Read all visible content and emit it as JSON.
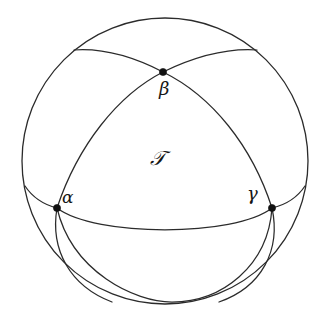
{
  "figure": {
    "background_color": "#ffffff",
    "stroke_color": "#2b2b2b",
    "vertex_color": "#111111",
    "label_color": "#161616"
  },
  "sphere": {
    "outline_name": "sphere-outline-circle",
    "center_x": 165,
    "center_y": 161,
    "radius": 143
  },
  "vertices": [
    {
      "id": "alpha",
      "label": "α",
      "x": 57,
      "y": 208
    },
    {
      "id": "beta",
      "label": "β",
      "x": 163,
      "y": 72
    },
    {
      "id": "gamma",
      "label": "γ",
      "x": 272,
      "y": 208
    }
  ],
  "region": {
    "id": "T",
    "label": "𝒯",
    "x": 163,
    "y": 160
  },
  "arcs": [
    {
      "id": "arc-alpha-beta",
      "from": "alpha",
      "to": "beta",
      "visible": true
    },
    {
      "id": "arc-beta-gamma",
      "from": "beta",
      "to": "gamma",
      "visible": true
    },
    {
      "id": "arc-alpha-gamma",
      "from": "alpha",
      "to": "gamma",
      "visible": true
    },
    {
      "id": "arc-beta-upper-left",
      "from": "beta",
      "to": "sphere-edge-upper-left",
      "visible": true
    },
    {
      "id": "arc-beta-upper-right",
      "from": "beta",
      "to": "sphere-edge-upper-right",
      "visible": true
    },
    {
      "id": "arc-alpha-lower",
      "from": "alpha",
      "to": "sphere-edge-lower",
      "visible": true
    },
    {
      "id": "arc-gamma-lower",
      "from": "gamma",
      "to": "sphere-edge-lower",
      "visible": true
    },
    {
      "id": "arc-equator-lower",
      "from": "alpha",
      "to": "gamma",
      "visible": true
    }
  ]
}
